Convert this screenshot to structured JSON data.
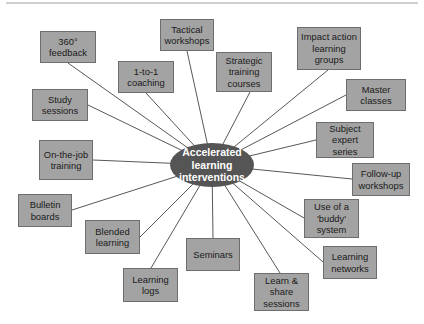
{
  "diagram": {
    "type": "mind-map",
    "colors": {
      "node_fill": "#a3a3a3",
      "node_border": "#6e6e6e",
      "hub_fill": "#555555",
      "hub_text": "#ffffff",
      "line": "#444444"
    },
    "hub": {
      "label": "Accelerated learning interventions",
      "cx": 212,
      "cy": 165,
      "rx": 42,
      "ry": 22
    },
    "nodes": [
      {
        "id": "n1",
        "label": "360° feedback",
        "x": 40,
        "y": 31,
        "w": 56,
        "h": 32,
        "ax": 68,
        "ay": 63
      },
      {
        "id": "n2",
        "label": "Tactical workshops",
        "x": 160,
        "y": 19,
        "w": 54,
        "h": 32,
        "ax": 187,
        "ay": 51
      },
      {
        "id": "n3",
        "label": "1-to-1 coaching",
        "x": 118,
        "y": 61,
        "w": 56,
        "h": 32,
        "ax": 146,
        "ay": 93
      },
      {
        "id": "n4",
        "label": "Strategic training courses",
        "x": 216,
        "y": 52,
        "w": 56,
        "h": 40,
        "ax": 250,
        "ay": 92
      },
      {
        "id": "n5",
        "label": "Impact action learning groups",
        "x": 297,
        "y": 27,
        "w": 64,
        "h": 43,
        "ax": 328,
        "ay": 70
      },
      {
        "id": "n6",
        "label": "Study sessions",
        "x": 32,
        "y": 89,
        "w": 56,
        "h": 32,
        "ax": 88,
        "ay": 105
      },
      {
        "id": "n7",
        "label": "Master classes",
        "x": 346,
        "y": 79,
        "w": 60,
        "h": 32,
        "ax": 346,
        "ay": 95
      },
      {
        "id": "n8",
        "label": "On-the-job training",
        "x": 39,
        "y": 140,
        "w": 54,
        "h": 40,
        "ax": 93,
        "ay": 160
      },
      {
        "id": "n9",
        "label": "Subject expert series",
        "x": 316,
        "y": 122,
        "w": 58,
        "h": 36,
        "ax": 316,
        "ay": 140
      },
      {
        "id": "n10",
        "label": "Follow-up workshops",
        "x": 352,
        "y": 163,
        "w": 58,
        "h": 33,
        "ax": 352,
        "ay": 179
      },
      {
        "id": "n11",
        "label": "Bulletin boards",
        "x": 18,
        "y": 194,
        "w": 54,
        "h": 33,
        "ax": 72,
        "ay": 210
      },
      {
        "id": "n12",
        "label": "Use of a 'buddy' system",
        "x": 304,
        "y": 199,
        "w": 55,
        "h": 39,
        "ax": 304,
        "ay": 218
      },
      {
        "id": "n13",
        "label": "Blended learning",
        "x": 85,
        "y": 220,
        "w": 55,
        "h": 34,
        "ax": 140,
        "ay": 237
      },
      {
        "id": "n14",
        "label": "Seminars",
        "x": 186,
        "y": 238,
        "w": 54,
        "h": 33,
        "ax": 213,
        "ay": 238
      },
      {
        "id": "n15",
        "label": "Learning networks",
        "x": 323,
        "y": 246,
        "w": 54,
        "h": 33,
        "ax": 323,
        "ay": 262
      },
      {
        "id": "n16",
        "label": "Learning logs",
        "x": 123,
        "y": 268,
        "w": 55,
        "h": 34,
        "ax": 151,
        "ay": 268
      },
      {
        "id": "n17",
        "label": "Learn & share sessions",
        "x": 254,
        "y": 273,
        "w": 55,
        "h": 38,
        "ax": 280,
        "ay": 273
      }
    ]
  }
}
